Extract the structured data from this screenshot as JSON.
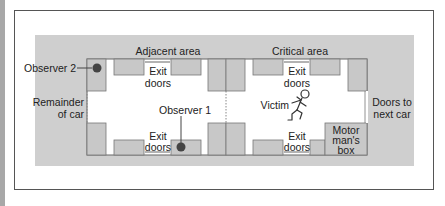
{
  "diagram": {
    "labels": {
      "adjacent_area": "Adjacent area",
      "critical_area": "Critical area",
      "observer_2": "Observer 2",
      "observer_1": "Observer 1",
      "remainder_line1": "Remainder",
      "remainder_line2": "of car",
      "doors_next_line1": "Doors to",
      "doors_next_line2": "next car",
      "victim": "Victim",
      "exit_top_left_1": "Exit",
      "exit_top_left_2": "doors",
      "exit_top_right_1": "Exit",
      "exit_top_right_2": "doors",
      "exit_bottom_left_1": "Exit",
      "exit_bottom_left_2": "doors",
      "exit_bottom_right_1": "Exit",
      "exit_bottom_right_2": "doors",
      "motorman_1": "Motor",
      "motorman_2": "man's",
      "motorman_3": "box"
    },
    "colors": {
      "gray_band": "#cfcfcf",
      "seat": "#c8c8c8",
      "border": "#555555",
      "observer_dot": "#444444"
    }
  }
}
